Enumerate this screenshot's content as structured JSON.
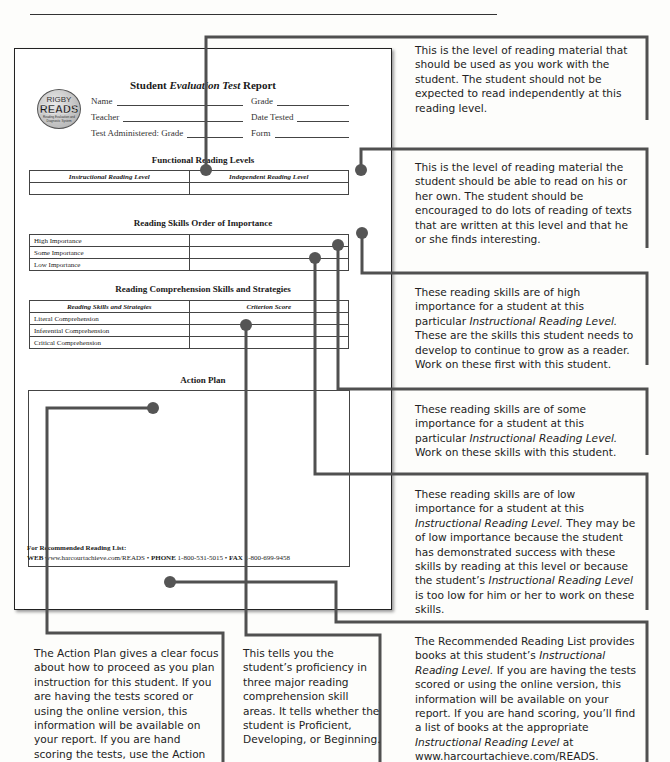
{
  "report": {
    "title_prefix": "Student ",
    "title_italic": "Evaluation Test",
    "title_suffix": " Report",
    "logo": {
      "line1": "RIGBY",
      "line2": "READS",
      "line3": "Reading Evaluation and Diagnostic System"
    },
    "fields": {
      "name": "Name",
      "grade": "Grade",
      "teacher": "Teacher",
      "date_tested": "Date Tested",
      "test_administered": "Test Administered: Grade",
      "form": "Form"
    },
    "functional_levels": {
      "title": "Functional Reading Levels",
      "headers": [
        "Instructional Reading Level",
        "Independent Reading Level"
      ]
    },
    "skills_order": {
      "title": "Reading Skills Order of Importance",
      "rows": [
        "High Importance",
        "Some Importance",
        "Low Importance"
      ]
    },
    "comprehension": {
      "title": "Reading Comprehension Skills and Strategies",
      "headers": [
        "Reading Skills and Strategies",
        "Criterion Score"
      ],
      "rows": [
        "Literal Comprehension",
        "Inferential Comprehension",
        "Critical Comprehension"
      ]
    },
    "action_plan": {
      "title": "Action Plan"
    },
    "footer": {
      "recommended": "For Recommended Reading List:",
      "web_label": "WEB",
      "web": "www.harcourtachieve.com/READS",
      "phone_label": "PHONE",
      "phone": "1-800-531-5015",
      "fax_label": "FAX",
      "fax": "1-800-699-9458",
      "sep": "•"
    }
  },
  "callouts": {
    "instructional": "This is the level of reading material that should be used as you work with the student. The student should not be expected to read independently at this reading level.",
    "independent": "This is the level of reading material the student should be able to read on his or her own. The student should be encouraged to do lots of reading of texts that are written at this level and that he or she finds interesting.",
    "high": {
      "a": "These reading skills are of high importance for a student at this particular ",
      "i": "Instructional Reading Level.",
      "b": " These are the skills this student needs to develop to continue to grow as a reader. Work on these first with this student."
    },
    "some": {
      "a": "These reading skills are of some importance for a student at this particular ",
      "i": "Instructional Reading Level.",
      "b": " Work on these skills with this student."
    },
    "low": {
      "a": "These reading skills are of low importance for a student at this ",
      "i": "Instructional Reading Level.",
      "b": " They may be of low importance because the student has demonstrated success with these skills by reading at this level or because the student’s ",
      "i2": "Instructional Reading Level",
      "c": " is too low for him or her to work on these skills."
    },
    "reading_list": {
      "a": "The Recommended Reading List provides books at this student’s ",
      "i": "Instructional Reading Level.",
      "b": " If you are having the tests scored or using the online version, this information will be available on your report. If you are hand scoring, you’ll find a list of books at the appropriate ",
      "i2": "Instructional Reading Level",
      "c": " at www.harcourtachieve.com/READS."
    },
    "action_plan": "The Action Plan gives a clear focus about how to proceed as you plan instruction for this student. If you are having the tests scored or using the online version, this information will be available on your report. If you are hand scoring the tests, use the Action",
    "proficiency": "This tells you the student’s proficiency in three major reading comprehension skill areas. It tells whether the student is Proficient, Developing, or Beginning."
  },
  "colors": {
    "connector": "#505050",
    "dot": "#555555"
  }
}
